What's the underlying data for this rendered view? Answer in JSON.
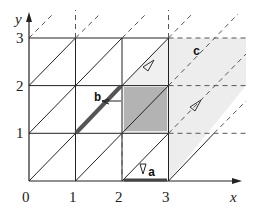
{
  "diagram": {
    "type": "lattice-triangulation",
    "axes": {
      "x_label": "x",
      "y_label": "y"
    },
    "x_ticks": [
      "0",
      "1",
      "2",
      "3"
    ],
    "y_ticks": [
      "1",
      "2",
      "3"
    ],
    "regions": [
      {
        "label": "a",
        "description": "bold segment on x-axis from x=2 to x=3 with small arrow pointing down"
      },
      {
        "label": "b",
        "description": "bold diagonal segment from (1,1) to (2,2) with arrow"
      },
      {
        "label": "c",
        "description": "light shaded parallelogram region beyond x=3"
      }
    ],
    "shaded_square": "unit square [2,3]x[1,2], dark gray",
    "colors": {
      "dark_shade": "#b3b3b3",
      "light_shade": "#ececec",
      "line": "#222222",
      "dashed": "#555555"
    }
  }
}
